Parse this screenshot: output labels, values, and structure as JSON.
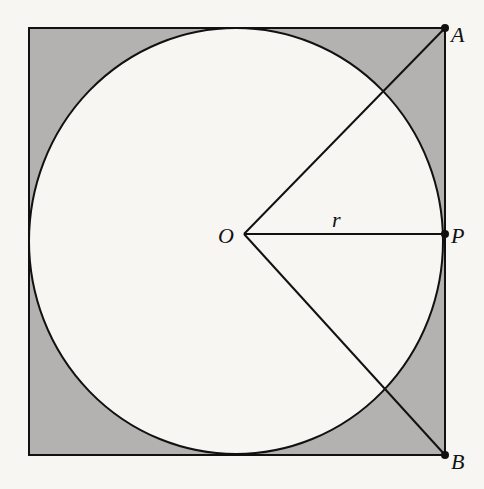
{
  "diagram": {
    "type": "geometry",
    "colors": {
      "background": "#f7f6f2",
      "shade": "#b3b2b0",
      "circle_fill": "#f7f6f2",
      "stroke": "#111111"
    },
    "labels": {
      "A": "A",
      "B": "B",
      "P": "P",
      "O": "O",
      "r": "r"
    },
    "points": {
      "A": [
        445,
        28
      ],
      "P": [
        445,
        234
      ],
      "B": [
        445,
        455
      ],
      "O": [
        244,
        234
      ]
    },
    "square": {
      "x": 29,
      "y": 28,
      "w": 416,
      "h": 427
    },
    "circle": {
      "cx": 236,
      "cy": 241,
      "rx": 207,
      "ry": 213
    }
  }
}
